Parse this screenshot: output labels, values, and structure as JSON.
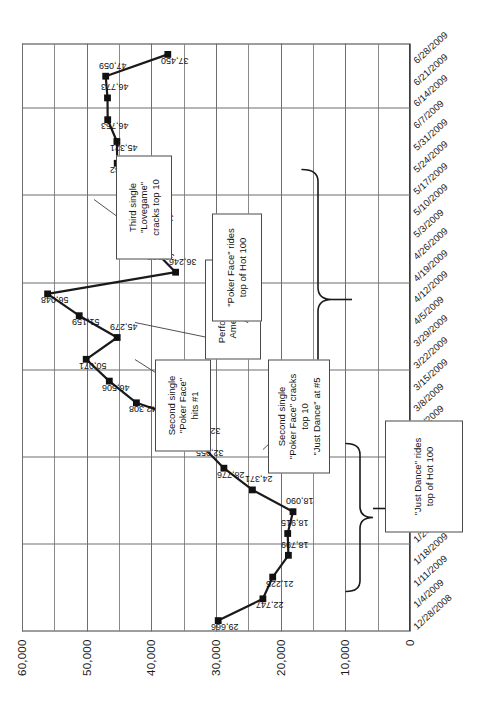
{
  "chart_data": {
    "type": "line",
    "title": "",
    "xlabel": "",
    "ylabel": "Sales in units",
    "ylim": [
      0,
      60000
    ],
    "ytick_labels": [
      "0",
      "10,000",
      "20,000",
      "30,000",
      "40,000",
      "50,000",
      "60,000"
    ],
    "ytick_values": [
      0,
      10000,
      20000,
      30000,
      40000,
      50000,
      60000
    ],
    "grid": true,
    "legend": "none",
    "categories": [
      "12/28/2008",
      "1/4/2009",
      "1/11/2009",
      "1/18/2009",
      "1/25/2009",
      "2/1/2009",
      "2/8/2009",
      "2/15/2009",
      "2/22/2009",
      "3/1/2009",
      "3/8/2009",
      "3/15/2009",
      "3/22/2009",
      "3/29/2009",
      "4/5/2009",
      "4/12/2009",
      "4/19/2009",
      "4/26/2009",
      "5/3/2009",
      "5/10/2009",
      "5/17/2009",
      "5/24/2009",
      "5/31/2009",
      "6/7/2009",
      "6/14/2009",
      "6/21/2009",
      "6/28/2009"
    ],
    "values": [
      29666,
      22747,
      21225,
      18799,
      18915,
      18090,
      24371,
      28776,
      32055,
      32497,
      42308,
      46506,
      50071,
      45279,
      51159,
      56048,
      36246,
      39555,
      39781,
      41328,
      41418,
      45282,
      45321,
      46753,
      46773,
      47059,
      37450
    ],
    "point_labels": [
      "29,666",
      "22,747",
      "21,225",
      "18,799",
      "18,915",
      "18,090",
      "24,371",
      "28,776",
      "32,055",
      "32,497",
      "42,308",
      "46,506",
      "50,071",
      "45,279",
      "51,159",
      "56,048",
      "36,246",
      "39,555",
      "39,781",
      "41,328",
      "41,418",
      "45,282",
      "45,321",
      "46,753",
      "46,773",
      "47,059",
      "37,450"
    ],
    "annotations": [
      {
        "name": "just-dance-brace",
        "lines": [
          "\"Just Dance\" rides",
          "top of Hot 100"
        ],
        "style": "brace"
      },
      {
        "name": "poker-face-cracks-top10",
        "lines": [
          "Second single",
          "\"Poker Face\" cracks",
          "top 10",
          "\"Just Dance\" at #5"
        ],
        "style": "box"
      },
      {
        "name": "poker-face-hits-1",
        "lines": [
          "Second single",
          "\"Poker Face\"",
          "hits #1"
        ],
        "style": "box"
      },
      {
        "name": "american-idol",
        "lines": [
          "Performance on",
          "American Idol",
          "April 1"
        ],
        "style": "box"
      },
      {
        "name": "poker-face-brace",
        "lines": [
          "\"Poker Face\" rides",
          "top of Hot 100"
        ],
        "style": "brace"
      },
      {
        "name": "lovegame-top10",
        "lines": [
          "Third single",
          "\"Lovegame\"",
          "cracks top 10"
        ],
        "style": "box"
      }
    ]
  },
  "colors": {
    "series": "#1a1a1a",
    "grid": "#6e6e6e",
    "frame": "#3d3d3d",
    "note_border": "#4a4a4a",
    "background": "#ffffff"
  }
}
